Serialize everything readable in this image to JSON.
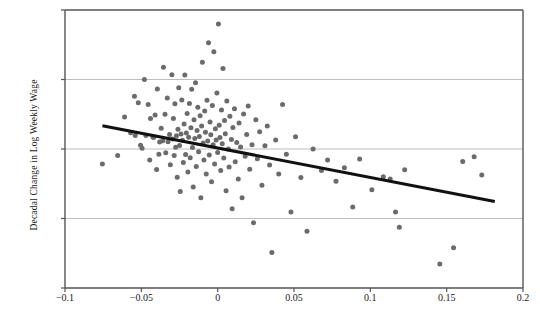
{
  "chart_data": {
    "type": "scatter",
    "title": "",
    "xlabel": "",
    "ylabel": "Decadal Change in Log Weekly Wage",
    "xlim": [
      -0.1,
      0.2
    ],
    "ylim": [
      -0.2,
      0.2
    ],
    "xticks": [
      -0.1,
      -0.05,
      0,
      0.05,
      0.1,
      0.15,
      0.2
    ],
    "xtick_labels": [
      "−0.1",
      "−0.05",
      "0",
      "0.05",
      "0.1",
      "0.15",
      "0.2"
    ],
    "yticks": [
      0.2,
      0.1,
      0,
      -0.1,
      -0.2
    ],
    "ytick_labels": [
      "0.2",
      "0.1",
      "0",
      "−0.1",
      "−0.2"
    ],
    "grid": true,
    "gridlines_y": [
      0.1,
      0,
      -0.1
    ],
    "legend": null,
    "marker_color": "#6b6b6b",
    "marker_size": 5,
    "fit_line": {
      "type": "linear",
      "color": "#111111",
      "width": 3,
      "x0": -0.0755,
      "y0": 0.0335,
      "x1": 0.1815,
      "y1": -0.0755,
      "slope": -0.424,
      "intercept": 0.0015
    },
    "points": [
      [
        -0.0755,
        -0.0215
      ],
      [
        -0.0655,
        -0.0095
      ],
      [
        -0.061,
        0.046
      ],
      [
        -0.057,
        0.0235
      ],
      [
        -0.0545,
        0.076
      ],
      [
        -0.054,
        0.0195
      ],
      [
        -0.052,
        0.0665
      ],
      [
        -0.0505,
        0.0055
      ],
      [
        -0.0495,
        0.001
      ],
      [
        -0.048,
        0.1
      ],
      [
        -0.047,
        0.0195
      ],
      [
        -0.0455,
        0.064
      ],
      [
        -0.0445,
        -0.016
      ],
      [
        -0.044,
        0.044
      ],
      [
        -0.0425,
        0.0175
      ],
      [
        -0.042,
        0.0165
      ],
      [
        -0.041,
        0.049
      ],
      [
        -0.04,
        -0.0295
      ],
      [
        -0.0395,
        0.0865
      ],
      [
        -0.0385,
        -0.0075
      ],
      [
        -0.038,
        0.01
      ],
      [
        -0.037,
        0.03
      ],
      [
        -0.036,
        0.012
      ],
      [
        -0.0355,
        0.1175
      ],
      [
        -0.0345,
        0.05
      ],
      [
        -0.034,
        -0.0055
      ],
      [
        -0.033,
        0.0735
      ],
      [
        -0.0325,
        0.0105
      ],
      [
        -0.0315,
        0.021
      ],
      [
        -0.031,
        -0.0225
      ],
      [
        -0.03,
        0.107
      ],
      [
        -0.0295,
        0.0145
      ],
      [
        -0.029,
        0.044
      ],
      [
        -0.0285,
        -0.0095
      ],
      [
        -0.028,
        0.065
      ],
      [
        -0.0275,
        0.0025
      ],
      [
        -0.027,
        0.019
      ],
      [
        -0.0265,
        -0.0405
      ],
      [
        -0.026,
        0.0285
      ],
      [
        -0.0255,
        0.088
      ],
      [
        -0.025,
        0.005
      ],
      [
        -0.0245,
        -0.061
      ],
      [
        -0.024,
        0.0215
      ],
      [
        -0.0235,
        0.0705
      ],
      [
        -0.023,
        0.0125
      ],
      [
        -0.0225,
        -0.0195
      ],
      [
        -0.022,
        0.036
      ],
      [
        -0.0215,
        0.1065
      ],
      [
        -0.021,
        -0.008
      ],
      [
        -0.0205,
        0.023
      ],
      [
        -0.02,
        0.051
      ],
      [
        -0.0195,
        -0.033
      ],
      [
        -0.019,
        0.017
      ],
      [
        -0.0185,
        0.0655
      ],
      [
        -0.018,
        -0.0125
      ],
      [
        -0.0175,
        0.0305
      ],
      [
        -0.017,
        0.086
      ],
      [
        -0.0165,
        0.002
      ],
      [
        -0.016,
        -0.0545
      ],
      [
        -0.0155,
        0.042
      ],
      [
        -0.015,
        0.015
      ],
      [
        -0.0145,
        0.0955
      ],
      [
        -0.014,
        -0.025
      ],
      [
        -0.0135,
        0.0265
      ],
      [
        -0.013,
        0.06
      ],
      [
        -0.0125,
        -0.004
      ],
      [
        -0.012,
        0.018
      ],
      [
        -0.0115,
        0.048
      ],
      [
        -0.011,
        -0.07
      ],
      [
        -0.0105,
        0.033
      ],
      [
        -0.01,
        0.125
      ],
      [
        -0.0095,
        0.0085
      ],
      [
        -0.009,
        -0.016
      ],
      [
        -0.0085,
        0.0545
      ],
      [
        -0.008,
        0.024
      ],
      [
        -0.0075,
        -0.036
      ],
      [
        -0.007,
        0.07
      ],
      [
        -0.0065,
        0.0115
      ],
      [
        -0.006,
        0.153
      ],
      [
        -0.0055,
        -0.0085
      ],
      [
        -0.005,
        0.039
      ],
      [
        -0.0045,
        0.0205
      ],
      [
        -0.004,
        -0.047
      ],
      [
        -0.0035,
        0.0625
      ],
      [
        -0.003,
        0.006
      ],
      [
        -0.0025,
        0.14
      ],
      [
        -0.002,
        -0.0215
      ],
      [
        -0.0015,
        0.029
      ],
      [
        -0.001,
        0.013
      ],
      [
        -0.0005,
        0.0805
      ],
      [
        0.0,
        -0.005
      ],
      [
        0.0005,
        0.18
      ],
      [
        0.001,
        0.034
      ],
      [
        0.0015,
        0.0165
      ],
      [
        0.002,
        -0.031
      ],
      [
        0.0025,
        0.056
      ],
      [
        0.003,
        0.0075
      ],
      [
        0.0035,
        0.116
      ],
      [
        0.004,
        -0.013
      ],
      [
        0.0045,
        0.041
      ],
      [
        0.005,
        0.022
      ],
      [
        0.0055,
        -0.06
      ],
      [
        0.006,
        0.069
      ],
      [
        0.007,
        0.0
      ],
      [
        0.0075,
        -0.026
      ],
      [
        0.008,
        0.047
      ],
      [
        0.009,
        0.0135
      ],
      [
        0.0095,
        -0.086
      ],
      [
        0.01,
        0.031
      ],
      [
        0.011,
        0.058
      ],
      [
        0.0115,
        -0.0185
      ],
      [
        0.0125,
        0.0095
      ],
      [
        0.0135,
        -0.043
      ],
      [
        0.014,
        0.0375
      ],
      [
        0.015,
        0.003
      ],
      [
        0.016,
        -0.07
      ],
      [
        0.017,
        0.0505
      ],
      [
        0.018,
        -0.0105
      ],
      [
        0.019,
        0.021
      ],
      [
        0.02,
        0.062
      ],
      [
        0.021,
        -0.029
      ],
      [
        0.0225,
        0.006
      ],
      [
        0.0235,
        -0.106
      ],
      [
        0.025,
        0.042
      ],
      [
        0.026,
        -0.014
      ],
      [
        0.0275,
        0.025
      ],
      [
        0.029,
        -0.052
      ],
      [
        0.031,
        0.0045
      ],
      [
        0.0325,
        0.033
      ],
      [
        0.034,
        -0.023
      ],
      [
        0.0355,
        -0.149
      ],
      [
        0.038,
        0.013
      ],
      [
        0.04,
        -0.036
      ],
      [
        0.0425,
        0.064
      ],
      [
        0.045,
        -0.0075
      ],
      [
        0.048,
        -0.0905
      ],
      [
        0.051,
        0.0175
      ],
      [
        0.0545,
        -0.041
      ],
      [
        0.0585,
        -0.1185
      ],
      [
        0.0625,
        0.0
      ],
      [
        0.068,
        -0.031
      ],
      [
        0.072,
        -0.016
      ],
      [
        0.0775,
        -0.0465
      ],
      [
        0.083,
        -0.027
      ],
      [
        0.0885,
        -0.0835
      ],
      [
        0.093,
        -0.0145
      ],
      [
        0.101,
        -0.0585
      ],
      [
        0.1085,
        -0.04
      ],
      [
        0.113,
        -0.043
      ],
      [
        0.1165,
        -0.0905
      ],
      [
        0.119,
        -0.1125
      ],
      [
        0.1225,
        -0.03
      ],
      [
        0.1455,
        -0.1655
      ],
      [
        0.1545,
        -0.142
      ],
      [
        0.1605,
        -0.018
      ],
      [
        0.168,
        -0.011
      ],
      [
        0.173,
        -0.0375
      ]
    ]
  }
}
